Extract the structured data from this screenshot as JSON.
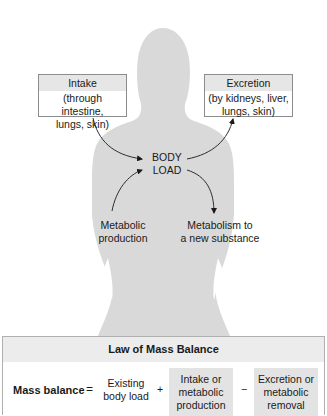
{
  "diagram": {
    "intake_box": {
      "title": "Intake",
      "detail_line1": "(through intestine,",
      "detail_line2": "lungs, skin)"
    },
    "excretion_box": {
      "title": "Excretion",
      "detail_line1": "(by kidneys, liver,",
      "detail_line2": "lungs, skin)"
    },
    "body_load": {
      "line1": "BODY",
      "line2": "LOAD"
    },
    "metabolic_production": {
      "line1": "Metabolic",
      "line2": "production"
    },
    "metabolism_new_substance": {
      "line1": "Metabolism to",
      "line2": "a new substance"
    },
    "arrows": [
      {
        "from": "intake_box",
        "to": "body_load"
      },
      {
        "from": "body_load",
        "to": "excretion_box"
      },
      {
        "from": "metabolic_production",
        "to": "body_load"
      },
      {
        "from": "body_load",
        "to": "metabolism_new_substance"
      }
    ],
    "colors": {
      "silhouette": "#d9d9d9",
      "box_header": "#e6e6e6",
      "box_border": "#8c8c8c",
      "panel_header": "#ececec",
      "highlight_cell": "#e3e3e3",
      "text": "#1a1a1a"
    }
  },
  "law_panel": {
    "title": "Law of Mass Balance",
    "lhs": "Mass balance",
    "equals": "=",
    "term1_line1": "Existing",
    "term1_line2": "body load",
    "plus": "+",
    "term2_line1": "Intake or",
    "term2_line2": "metabolic",
    "term2_line3": "production",
    "minus": "−",
    "term3_line1": "Excretion or",
    "term3_line2": "metabolic",
    "term3_line3": "removal"
  }
}
